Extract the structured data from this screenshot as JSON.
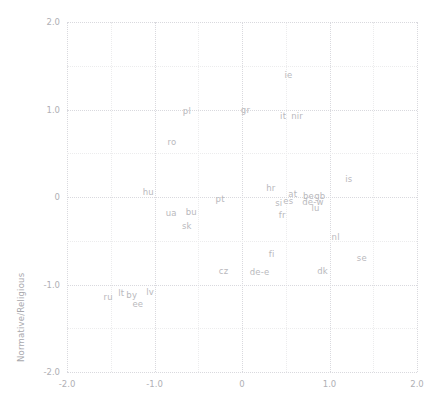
{
  "chart_data": {
    "type": "scatter",
    "title": "",
    "subtitle": "",
    "xlabel": "",
    "ylabel": "Normative/Religious",
    "xlim": [
      -2.0,
      2.0
    ],
    "ylim": [
      -2.0,
      2.0
    ],
    "xticks": [
      "-2.0",
      "-1.0",
      "0",
      "1.0",
      "2.0"
    ],
    "xtick_values": [
      -2.0,
      -1.0,
      0,
      1.0,
      2.0
    ],
    "yticks": [
      "2.0",
      "1.0",
      "0",
      "-1.0",
      "-2.0"
    ],
    "ytick_values": [
      2.0,
      1.0,
      0,
      -1.0,
      -2.0
    ],
    "grid": true,
    "grid_minor_step": 0.5,
    "legend": "none",
    "marker_style": "text-label-only",
    "label_color": "#b9b9bd",
    "grid_color": "#d9d9de",
    "grid_minor_color": "#ececed",
    "points": [
      {
        "label": "ie",
        "x": 0.53,
        "y": 1.4
      },
      {
        "label": "pl",
        "x": -0.63,
        "y": 0.98
      },
      {
        "label": "gr",
        "x": 0.04,
        "y": 0.99
      },
      {
        "label": "it",
        "x": 0.47,
        "y": 0.93
      },
      {
        "label": "nir",
        "x": 0.63,
        "y": 0.93
      },
      {
        "label": "ro",
        "x": -0.8,
        "y": 0.63
      },
      {
        "label": "is",
        "x": 1.22,
        "y": 0.21
      },
      {
        "label": "hr",
        "x": 0.33,
        "y": 0.1
      },
      {
        "label": "hu",
        "x": -1.07,
        "y": 0.06
      },
      {
        "label": "at",
        "x": 0.58,
        "y": 0.03
      },
      {
        "label": "be",
        "x": 0.76,
        "y": 0.01
      },
      {
        "label": "gb",
        "x": 0.89,
        "y": 0.01
      },
      {
        "label": "pt",
        "x": -0.25,
        "y": -0.02
      },
      {
        "label": "es",
        "x": 0.53,
        "y": -0.05
      },
      {
        "label": "de-w",
        "x": 0.81,
        "y": -0.06
      },
      {
        "label": "si",
        "x": 0.42,
        "y": -0.07
      },
      {
        "label": "lu",
        "x": 0.84,
        "y": -0.13
      },
      {
        "label": "fr",
        "x": 0.46,
        "y": -0.2
      },
      {
        "label": "ua",
        "x": -0.81,
        "y": -0.18
      },
      {
        "label": "bu",
        "x": -0.58,
        "y": -0.17
      },
      {
        "label": "sk",
        "x": -0.63,
        "y": -0.33
      },
      {
        "label": "nl",
        "x": 1.07,
        "y": -0.46
      },
      {
        "label": "fi",
        "x": 0.34,
        "y": -0.65
      },
      {
        "label": "se",
        "x": 1.37,
        "y": -0.7
      },
      {
        "label": "cz",
        "x": -0.21,
        "y": -0.85
      },
      {
        "label": "de-e",
        "x": 0.2,
        "y": -0.86
      },
      {
        "label": "dk",
        "x": 0.92,
        "y": -0.85
      },
      {
        "label": "lt",
        "x": -1.38,
        "y": -1.1
      },
      {
        "label": "by",
        "x": -1.26,
        "y": -1.12
      },
      {
        "label": "lv",
        "x": -1.05,
        "y": -1.09
      },
      {
        "label": "ru",
        "x": -1.53,
        "y": -1.14
      },
      {
        "label": "ee",
        "x": -1.19,
        "y": -1.22
      }
    ]
  }
}
